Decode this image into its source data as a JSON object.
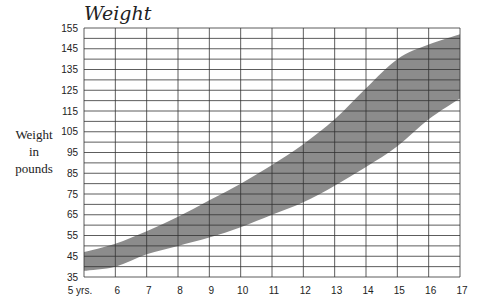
{
  "chart_data": {
    "type": "area",
    "title": "Weight",
    "xlabel": "",
    "ylabel": "Weight in pounds",
    "ylabel_lines": [
      "Weight",
      "in",
      "pounds"
    ],
    "x": [
      5,
      6,
      7,
      8,
      9,
      10,
      11,
      12,
      13,
      14,
      15,
      16,
      17
    ],
    "x_tick_labels": [
      "5 yrs.",
      "6",
      "7",
      "8",
      "9",
      "10",
      "11",
      "12",
      "13",
      "14",
      "15",
      "16",
      "17"
    ],
    "y_tick_labels": [
      "35",
      "45",
      "55",
      "65",
      "75",
      "85",
      "95",
      "105",
      "115",
      "125",
      "135",
      "145",
      "155"
    ],
    "xlim": [
      5,
      17
    ],
    "ylim": [
      35,
      155
    ],
    "grid": true,
    "grid_minor_y_step": 5,
    "legend": "none",
    "series": [
      {
        "name": "upper bound",
        "values": [
          47,
          51,
          57,
          64,
          72,
          80,
          89,
          99,
          111,
          126,
          140,
          147,
          152
        ]
      },
      {
        "name": "lower bound",
        "values": [
          38,
          40,
          46,
          50,
          54,
          59,
          65,
          71,
          79,
          88,
          98,
          111,
          121
        ]
      }
    ],
    "band_color": "#8c8c8c"
  }
}
